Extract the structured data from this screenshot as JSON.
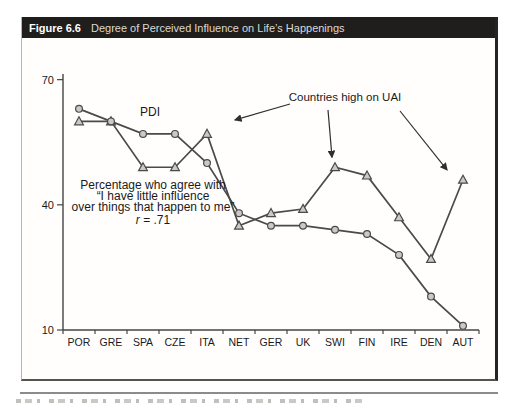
{
  "figure": {
    "label": "Figure 6.6",
    "title": "Degree of Perceived Influence on Life’s Happenings"
  },
  "chart_data": {
    "type": "line",
    "categories": [
      "POR",
      "GRE",
      "SPA",
      "CZE",
      "ITA",
      "NET",
      "GER",
      "UK",
      "SWI",
      "FIN",
      "IRE",
      "DEN",
      "AUT"
    ],
    "series": [
      {
        "name": "PDI",
        "marker": "circle",
        "values": [
          63,
          60,
          57,
          57,
          50,
          38,
          35,
          35,
          34,
          33,
          28,
          18,
          11
        ]
      },
      {
        "name": "Percentage who agree",
        "marker": "triangle",
        "values": [
          60,
          60,
          49,
          49,
          57,
          35,
          38,
          39,
          49,
          47,
          37,
          27,
          46
        ]
      }
    ],
    "ylim": [
      10,
      70
    ],
    "yticks": [
      10,
      40,
      70
    ],
    "grid": false,
    "legend": "inline-annotations",
    "line_color": "#4a4a4a",
    "marker_fill": "#c9c9c9",
    "annotations": {
      "series_label": "PDI",
      "question_lines": [
        "Percentage who agree with",
        "“I have little influence",
        "over things that happen to me”"
      ],
      "r_line": {
        "italic": "r",
        "rest": " = .71"
      },
      "uai_label": "Countries high on UAI",
      "uai_targets": [
        "ITA",
        "SWI",
        "AUT"
      ]
    }
  }
}
